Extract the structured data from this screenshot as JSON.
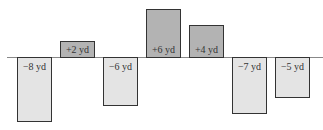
{
  "chart_data": {
    "type": "bar",
    "title": "",
    "xlabel": "",
    "ylabel": "",
    "unit": "yd",
    "categories": [
      "1",
      "2",
      "3",
      "4",
      "5",
      "6",
      "7"
    ],
    "values": [
      -8,
      2,
      -6,
      6,
      4,
      -7,
      -5
    ],
    "labels": [
      "−8 yd",
      "+2 yd",
      "−6 yd",
      "+6 yd",
      "+4 yd",
      "−7 yd",
      "−5 yd"
    ],
    "ylim": [
      -8,
      6
    ],
    "grid": false,
    "legend": null,
    "colors": {
      "positive": "#b3b3b3",
      "negative": "#e4e4e4",
      "border": "#333333"
    }
  }
}
